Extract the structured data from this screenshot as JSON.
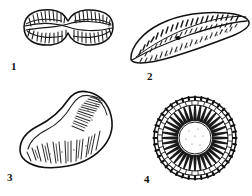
{
  "plate": {
    "width": 252,
    "height": 196,
    "background_color": "#ffffff",
    "ink_color": "#1a1a1a",
    "medium": "black ink line drawing on white ground",
    "subject": "four numbered microfossil / diatom valve specimens",
    "figure_count": 4
  },
  "labels": {
    "fig1": "1",
    "fig2": "2",
    "fig3": "3",
    "fig4": "4"
  },
  "figures": [
    {
      "number": "1",
      "label": "1",
      "shape": "panduriform",
      "description": "hourglass / fiddle-shaped valve with constricted centre and two rounded lobes",
      "orientation": "horizontal",
      "center": [
        68,
        27
      ],
      "bbox": [
        22,
        8,
        91,
        38
      ],
      "ornament": "comb-like transverse striae along each lobe margin",
      "label_position": [
        11,
        61
      ]
    },
    {
      "number": "2",
      "label": "2",
      "shape": "arcuate-lanceolate",
      "description": "long curved boat-shaped valve tapering to a pointed right apex, central nodule on axial raphe",
      "orientation": "diagonal, rising to the right",
      "center": [
        190,
        37
      ],
      "bbox": [
        130,
        12,
        120,
        50
      ],
      "ornament": "dense punctate stippling in rows flanking the central raphe",
      "label_position": [
        147,
        71
      ]
    },
    {
      "number": "3",
      "label": "3",
      "shape": "boot-shaped",
      "description": "L-shaped valve with a broad toe at lower left rising to a narrow heel at upper right",
      "orientation": "diagonal, rising to the right",
      "center": [
        66,
        131
      ],
      "bbox": [
        18,
        95,
        97,
        73
      ],
      "ornament": "radiating rows of puncta fanning from the inner margin",
      "label_position": [
        7,
        172
      ]
    },
    {
      "number": "4",
      "label": "4",
      "shape": "circular-centric",
      "description": "round centric valve with radiating wedge-shaped ribs around a clear hyaline centre and a beaded rim",
      "orientation": "plan view",
      "center": [
        195,
        138
      ],
      "radius": 41,
      "bbox": [
        154,
        97,
        82,
        82
      ],
      "ornament": "two concentric rings of radial costae plus a granulate marginal band",
      "label_position": [
        144,
        174
      ]
    }
  ]
}
